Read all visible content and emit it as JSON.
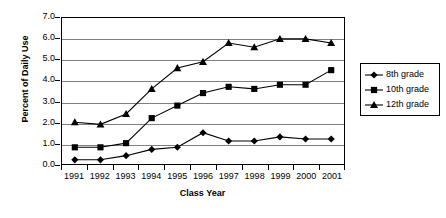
{
  "chart_data": {
    "type": "line",
    "title": "",
    "xlabel": "Class Year",
    "ylabel": "Percent of Daily Use",
    "categories": [
      "1991",
      "1992",
      "1993",
      "1994",
      "1995",
      "1996",
      "1997",
      "1998",
      "1999",
      "2000",
      "2001"
    ],
    "x": [
      1991,
      1992,
      1993,
      1994,
      1995,
      1996,
      1997,
      1998,
      1999,
      2000,
      2001
    ],
    "ylim": [
      0.0,
      7.0
    ],
    "ytick_labels": [
      "0.0",
      "1.0",
      "2.0",
      "3.0",
      "4.0",
      "5.0",
      "6.0",
      "7.0"
    ],
    "ytick_values": [
      0.0,
      1.0,
      2.0,
      3.0,
      4.0,
      5.0,
      6.0,
      7.0
    ],
    "grid": true,
    "grid_axis": "y",
    "legend_position": "right",
    "series": [
      {
        "name": "8th grade",
        "marker": "diamond",
        "color": "#000000",
        "values": [
          0.2,
          0.2,
          0.4,
          0.7,
          0.8,
          1.5,
          1.1,
          1.1,
          1.3,
          1.2,
          1.2
        ]
      },
      {
        "name": "10th grade",
        "marker": "square",
        "color": "#000000",
        "values": [
          0.8,
          0.8,
          1.0,
          2.2,
          2.8,
          3.4,
          3.7,
          3.6,
          3.8,
          3.8,
          4.5
        ]
      },
      {
        "name": "12th grade",
        "marker": "triangle",
        "color": "#000000",
        "values": [
          2.0,
          1.9,
          2.4,
          3.6,
          4.6,
          4.9,
          5.8,
          5.6,
          6.0,
          6.0,
          5.8
        ]
      }
    ]
  },
  "legend": {
    "entries": [
      {
        "label": "8th grade",
        "marker": "diamond"
      },
      {
        "label": "10th grade",
        "marker": "square"
      },
      {
        "label": "12th grade",
        "marker": "triangle"
      }
    ]
  },
  "colors": {
    "series": "#000000",
    "gridline": "#808080",
    "axis": "#000000",
    "background": "#ffffff"
  }
}
